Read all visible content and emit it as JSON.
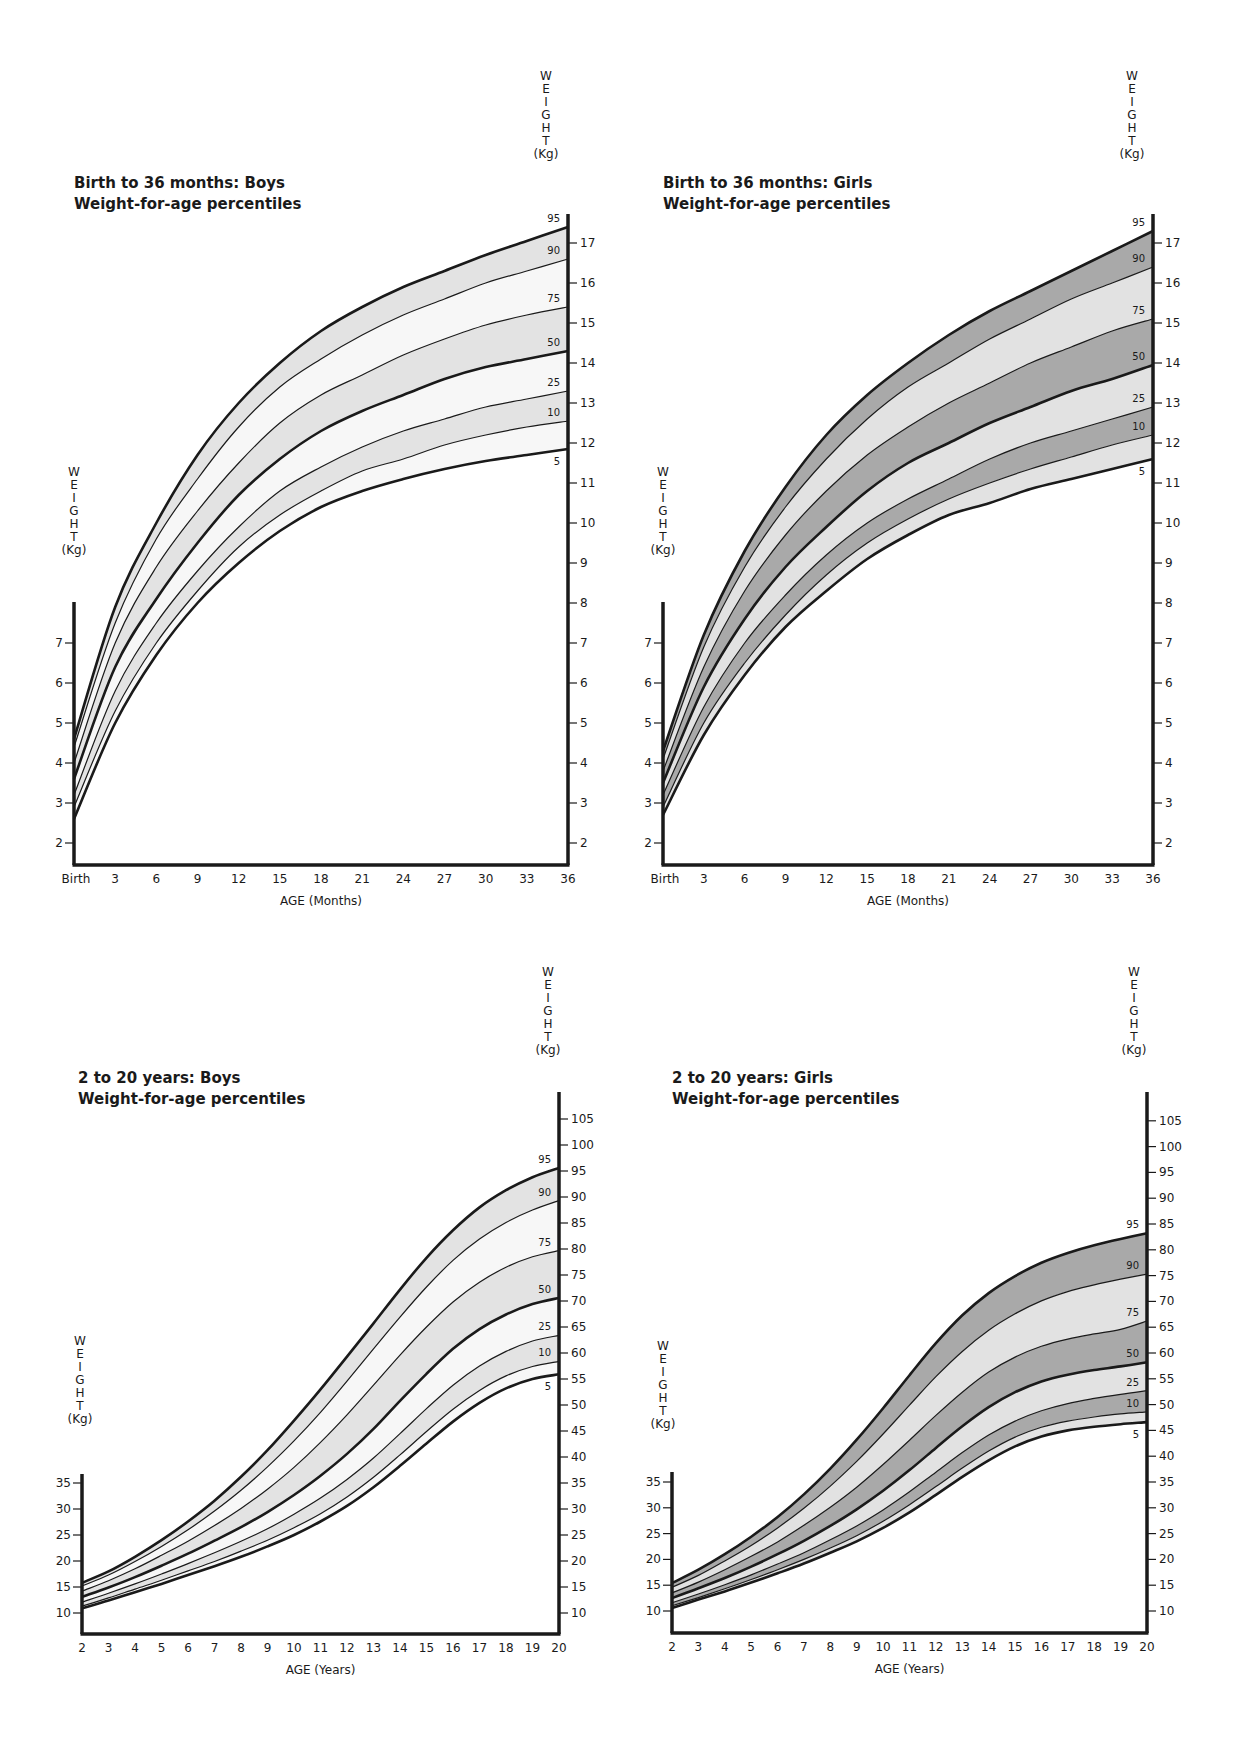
{
  "colors": {
    "ink": "#1a1a1a",
    "boys_band": "#e3e3e3",
    "boys_alt": "#f7f7f7",
    "girls_dark": "#a9a9a9",
    "girls_light": "#e2e2e2"
  },
  "chart_data": [
    {
      "id": "boys-infant",
      "type": "line",
      "title": "Birth to 36 months: Boys",
      "subtitle": "Weight-for-age percentiles",
      "xlabel": "AGE (Months)",
      "ylabel": "WEIGHT (Kg)",
      "x_ticks": [
        "Birth",
        "3",
        "6",
        "9",
        "12",
        "15",
        "18",
        "21",
        "24",
        "27",
        "30",
        "33",
        "36"
      ],
      "xlim": [
        0,
        36
      ],
      "left_y_ticks": [
        2,
        3,
        4,
        5,
        6,
        7
      ],
      "right_y_ticks": [
        2,
        3,
        4,
        5,
        6,
        7,
        8,
        9,
        10,
        11,
        12,
        13,
        14,
        15,
        16,
        17
      ],
      "ylim": [
        1.4,
        18.2
      ],
      "legend_position": "right-end labels",
      "grid": false,
      "x": [
        0,
        3,
        6,
        9,
        12,
        15,
        18,
        21,
        24,
        27,
        30,
        33,
        36
      ],
      "series": [
        {
          "name": "95",
          "values": [
            4.6,
            7.9,
            10.0,
            11.7,
            13.0,
            14.0,
            14.8,
            15.4,
            15.9,
            16.3,
            16.7,
            17.05,
            17.4
          ]
        },
        {
          "name": "90",
          "values": [
            4.4,
            7.5,
            9.6,
            11.1,
            12.4,
            13.4,
            14.1,
            14.7,
            15.2,
            15.6,
            16.0,
            16.3,
            16.6
          ]
        },
        {
          "name": "75",
          "values": [
            4.0,
            7.0,
            8.9,
            10.3,
            11.5,
            12.5,
            13.2,
            13.7,
            14.2,
            14.6,
            14.95,
            15.2,
            15.4
          ]
        },
        {
          "name": "50",
          "values": [
            3.6,
            6.4,
            8.1,
            9.5,
            10.7,
            11.6,
            12.3,
            12.8,
            13.2,
            13.6,
            13.9,
            14.1,
            14.3
          ]
        },
        {
          "name": "25",
          "values": [
            3.2,
            5.8,
            7.5,
            8.8,
            9.9,
            10.8,
            11.4,
            11.9,
            12.3,
            12.6,
            12.9,
            13.1,
            13.3
          ]
        },
        {
          "name": "10",
          "values": [
            2.9,
            5.3,
            7.0,
            8.3,
            9.4,
            10.2,
            10.8,
            11.3,
            11.6,
            11.95,
            12.2,
            12.4,
            12.55
          ]
        },
        {
          "name": "5",
          "values": [
            2.6,
            5.0,
            6.7,
            8.0,
            9.0,
            9.8,
            10.4,
            10.8,
            11.1,
            11.35,
            11.55,
            11.7,
            11.85
          ]
        }
      ],
      "thick_series": [
        "95",
        "50",
        "5"
      ],
      "bands": [
        [
          "95",
          "90",
          "boys_band"
        ],
        [
          "90",
          "75",
          "boys_alt"
        ],
        [
          "75",
          "50",
          "boys_band"
        ],
        [
          "50",
          "25",
          "boys_alt"
        ],
        [
          "25",
          "10",
          "boys_band"
        ],
        [
          "10",
          "5",
          "boys_alt"
        ]
      ],
      "layout": {
        "x0": 74,
        "x1": 568,
        "y_top_axis": 214,
        "y_left_top": 602,
        "y_bottom": 865,
        "kg_ref": 2,
        "kg_ref_y": 843,
        "px_per_kg": 40,
        "left_min": 2,
        "left_max": 7,
        "title_x": 74,
        "title_y": 188,
        "right_title_x": 546,
        "right_title_top": 80,
        "left_title_x": 74,
        "left_title_top": 476
      }
    },
    {
      "id": "girls-infant",
      "type": "line",
      "title": "Birth to 36 months: Girls",
      "subtitle": "Weight-for-age percentiles",
      "xlabel": "AGE (Months)",
      "ylabel": "WEIGHT (Kg)",
      "x_ticks": [
        "Birth",
        "3",
        "6",
        "9",
        "12",
        "15",
        "18",
        "21",
        "24",
        "27",
        "30",
        "33",
        "36"
      ],
      "xlim": [
        0,
        36
      ],
      "left_y_ticks": [
        2,
        3,
        4,
        5,
        6,
        7
      ],
      "right_y_ticks": [
        2,
        3,
        4,
        5,
        6,
        7,
        8,
        9,
        10,
        11,
        12,
        13,
        14,
        15,
        16,
        17
      ],
      "ylim": [
        1.4,
        18.2
      ],
      "legend_position": "right-end labels",
      "grid": false,
      "x": [
        0,
        3,
        6,
        9,
        12,
        15,
        18,
        21,
        24,
        27,
        30,
        33,
        36
      ],
      "series": [
        {
          "name": "95",
          "values": [
            4.3,
            7.2,
            9.3,
            10.9,
            12.2,
            13.2,
            14.0,
            14.7,
            15.3,
            15.8,
            16.3,
            16.8,
            17.3
          ]
        },
        {
          "name": "90",
          "values": [
            4.1,
            6.9,
            8.9,
            10.4,
            11.6,
            12.6,
            13.4,
            14.0,
            14.6,
            15.1,
            15.6,
            16.0,
            16.4
          ]
        },
        {
          "name": "75",
          "values": [
            3.8,
            6.4,
            8.3,
            9.7,
            10.8,
            11.7,
            12.4,
            13.0,
            13.5,
            14.0,
            14.4,
            14.8,
            15.1
          ]
        },
        {
          "name": "50",
          "values": [
            3.5,
            5.9,
            7.6,
            8.9,
            9.9,
            10.8,
            11.5,
            12.0,
            12.5,
            12.9,
            13.3,
            13.6,
            13.95
          ]
        },
        {
          "name": "25",
          "values": [
            3.2,
            5.4,
            7.0,
            8.2,
            9.2,
            10.0,
            10.6,
            11.1,
            11.6,
            12.0,
            12.3,
            12.6,
            12.9
          ]
        },
        {
          "name": "10",
          "values": [
            2.9,
            5.0,
            6.5,
            7.7,
            8.7,
            9.5,
            10.1,
            10.6,
            11.0,
            11.35,
            11.65,
            11.95,
            12.2
          ]
        },
        {
          "name": "5",
          "values": [
            2.7,
            4.7,
            6.2,
            7.4,
            8.3,
            9.1,
            9.7,
            10.2,
            10.5,
            10.85,
            11.1,
            11.35,
            11.6
          ]
        }
      ],
      "thick_series": [
        "95",
        "50",
        "5"
      ],
      "bands": [
        [
          "95",
          "90",
          "girls_dark"
        ],
        [
          "90",
          "75",
          "girls_light"
        ],
        [
          "75",
          "50",
          "girls_dark"
        ],
        [
          "50",
          "25",
          "girls_light"
        ],
        [
          "25",
          "10",
          "girls_dark"
        ],
        [
          "10",
          "5",
          "girls_light"
        ]
      ],
      "layout": {
        "x0": 663,
        "x1": 1153,
        "y_top_axis": 214,
        "y_left_top": 602,
        "y_bottom": 865,
        "kg_ref": 2,
        "kg_ref_y": 843,
        "px_per_kg": 40,
        "left_min": 2,
        "left_max": 7,
        "title_x": 663,
        "title_y": 188,
        "right_title_x": 1132,
        "right_title_top": 80,
        "left_title_x": 663,
        "left_title_top": 476
      }
    },
    {
      "id": "boys-youth",
      "type": "line",
      "title": "2 to 20 years: Boys",
      "subtitle": "Weight-for-age percentiles",
      "xlabel": "AGE (Years)",
      "ylabel": "WEIGHT (Kg)",
      "x_ticks": [
        "2",
        "3",
        "4",
        "5",
        "6",
        "7",
        "8",
        "9",
        "10",
        "11",
        "12",
        "13",
        "14",
        "15",
        "16",
        "17",
        "18",
        "19",
        "20"
      ],
      "xlim": [
        2,
        20
      ],
      "left_y_ticks": [
        10,
        15,
        20,
        25,
        30,
        35
      ],
      "right_y_ticks": [
        10,
        15,
        20,
        25,
        30,
        35,
        40,
        45,
        50,
        55,
        60,
        65,
        70,
        75,
        80,
        85,
        90,
        95,
        100,
        105
      ],
      "ylim": [
        6,
        109
      ],
      "legend_position": "right-end labels",
      "grid": false,
      "x": [
        2,
        3,
        4,
        5,
        6,
        7,
        8,
        9,
        10,
        11,
        12,
        13,
        14,
        15,
        16,
        17,
        18,
        19,
        20
      ],
      "series": [
        {
          "name": "95",
          "values": [
            15.8,
            18.0,
            20.8,
            24.0,
            27.6,
            31.6,
            36.2,
            41.3,
            47.0,
            53.0,
            59.3,
            65.7,
            72.2,
            78.3,
            83.6,
            88.0,
            91.3,
            93.8,
            95.6
          ]
        },
        {
          "name": "90",
          "values": [
            15.2,
            17.3,
            19.9,
            22.8,
            26.0,
            29.6,
            33.6,
            38.1,
            43.1,
            48.6,
            54.6,
            60.8,
            66.9,
            72.7,
            77.8,
            81.9,
            85.1,
            87.5,
            89.3
          ]
        },
        {
          "name": "75",
          "values": [
            14.2,
            16.2,
            18.5,
            21.1,
            23.8,
            26.8,
            30.1,
            33.8,
            38.0,
            42.8,
            48.1,
            53.8,
            59.6,
            65.0,
            69.8,
            73.6,
            76.5,
            78.5,
            79.7
          ]
        },
        {
          "name": "50",
          "values": [
            13.1,
            14.9,
            16.9,
            19.1,
            21.4,
            23.9,
            26.5,
            29.4,
            32.7,
            36.4,
            40.6,
            45.4,
            50.8,
            56.0,
            60.8,
            64.6,
            67.4,
            69.4,
            70.6
          ]
        },
        {
          "name": "25",
          "values": [
            12.1,
            13.8,
            15.6,
            17.5,
            19.5,
            21.6,
            23.8,
            26.2,
            29.0,
            32.1,
            35.7,
            39.8,
            44.5,
            49.3,
            53.8,
            57.5,
            60.3,
            62.3,
            63.4
          ]
        },
        {
          "name": "10",
          "values": [
            11.3,
            12.9,
            14.6,
            16.3,
            18.1,
            19.9,
            21.9,
            24.0,
            26.4,
            29.1,
            32.3,
            36.1,
            40.4,
            44.9,
            49.2,
            52.8,
            55.6,
            57.4,
            58.4
          ]
        },
        {
          "name": "5",
          "values": [
            10.9,
            12.4,
            14.0,
            15.6,
            17.3,
            19.0,
            20.8,
            22.8,
            25.0,
            27.6,
            30.6,
            34.2,
            38.3,
            42.6,
            46.8,
            50.4,
            53.2,
            55.0,
            55.9
          ]
        }
      ],
      "thick_series": [
        "95",
        "50",
        "5"
      ],
      "bands": [
        [
          "95",
          "90",
          "boys_band"
        ],
        [
          "90",
          "75",
          "boys_alt"
        ],
        [
          "75",
          "50",
          "boys_band"
        ],
        [
          "50",
          "25",
          "boys_alt"
        ],
        [
          "25",
          "10",
          "boys_band"
        ],
        [
          "10",
          "5",
          "boys_alt"
        ]
      ],
      "layout": {
        "x0": 82,
        "x1": 559,
        "y_top_axis": 1092,
        "y_left_top": 1474,
        "y_bottom": 1634,
        "kg_ref": 10,
        "kg_ref_y": 1613,
        "px_per_kg": 5.2,
        "left_min": 10,
        "left_max": 35,
        "title_x": 78,
        "title_y": 1083,
        "right_title_x": 548,
        "right_title_top": 976,
        "left_title_x": 80,
        "left_title_top": 1345
      }
    },
    {
      "id": "girls-youth",
      "type": "line",
      "title": "2 to 20 years: Girls",
      "subtitle": "Weight-for-age percentiles",
      "xlabel": "AGE (Years)",
      "ylabel": "WEIGHT (Kg)",
      "x_ticks": [
        "2",
        "3",
        "4",
        "5",
        "6",
        "7",
        "8",
        "9",
        "10",
        "11",
        "12",
        "13",
        "14",
        "15",
        "16",
        "17",
        "18",
        "19",
        "20"
      ],
      "xlim": [
        2,
        20
      ],
      "left_y_ticks": [
        10,
        15,
        20,
        25,
        30,
        35
      ],
      "right_y_ticks": [
        10,
        15,
        20,
        25,
        30,
        35,
        40,
        45,
        50,
        55,
        60,
        65,
        70,
        75,
        80,
        85,
        90,
        95,
        100,
        105
      ],
      "ylim": [
        6,
        109
      ],
      "legend_position": "right-end labels",
      "grid": false,
      "x": [
        2,
        3,
        4,
        5,
        6,
        7,
        8,
        9,
        10,
        11,
        12,
        13,
        14,
        15,
        16,
        17,
        18,
        19,
        20
      ],
      "series": [
        {
          "name": "95",
          "values": [
            15.4,
            18.0,
            21.0,
            24.4,
            28.2,
            32.6,
            37.6,
            43.2,
            49.3,
            55.7,
            61.9,
            67.3,
            71.6,
            74.9,
            77.5,
            79.4,
            80.9,
            82.1,
            83.2
          ]
        },
        {
          "name": "90",
          "values": [
            14.6,
            16.9,
            19.7,
            22.7,
            26.1,
            29.9,
            34.2,
            39.0,
            44.3,
            49.9,
            55.4,
            60.3,
            64.4,
            67.6,
            70.1,
            71.9,
            73.2,
            74.3,
            75.3
          ]
        },
        {
          "name": "75",
          "values": [
            13.5,
            15.6,
            18.0,
            20.6,
            23.4,
            26.6,
            30.1,
            34.0,
            38.4,
            43.1,
            47.9,
            52.4,
            56.3,
            59.2,
            61.3,
            62.7,
            63.7,
            64.6,
            66.2
          ]
        },
        {
          "name": "50",
          "values": [
            12.5,
            14.4,
            16.4,
            18.6,
            21.0,
            23.6,
            26.5,
            29.7,
            33.3,
            37.3,
            41.6,
            45.8,
            49.5,
            52.4,
            54.5,
            55.8,
            56.7,
            57.4,
            58.2
          ]
        },
        {
          "name": "25",
          "values": [
            11.6,
            13.3,
            15.1,
            17.0,
            19.1,
            21.3,
            23.8,
            26.5,
            29.6,
            33.1,
            36.9,
            40.7,
            44.1,
            46.8,
            48.8,
            50.2,
            51.2,
            52.0,
            52.7
          ]
        },
        {
          "name": "10",
          "values": [
            11.0,
            12.6,
            14.3,
            16.1,
            18.0,
            20.0,
            22.2,
            24.6,
            27.4,
            30.6,
            34.1,
            37.7,
            41.0,
            43.7,
            45.6,
            46.8,
            47.6,
            48.2,
            48.6
          ]
        },
        {
          "name": "5",
          "values": [
            10.6,
            12.2,
            13.8,
            15.5,
            17.3,
            19.2,
            21.3,
            23.5,
            26.1,
            29.1,
            32.5,
            36.0,
            39.2,
            41.9,
            43.8,
            45.0,
            45.7,
            46.2,
            46.6
          ]
        }
      ],
      "thick_series": [
        "95",
        "50",
        "5"
      ],
      "bands": [
        [
          "95",
          "90",
          "girls_dark"
        ],
        [
          "90",
          "75",
          "girls_light"
        ],
        [
          "75",
          "50",
          "girls_dark"
        ],
        [
          "50",
          "25",
          "girls_light"
        ],
        [
          "25",
          "10",
          "girls_dark"
        ],
        [
          "10",
          "5",
          "girls_light"
        ]
      ],
      "layout": {
        "x0": 672,
        "x1": 1147,
        "y_top_axis": 1092,
        "y_left_top": 1472,
        "y_bottom": 1633,
        "kg_ref": 10,
        "kg_ref_y": 1611,
        "px_per_kg": 5.16,
        "left_min": 10,
        "left_max": 35,
        "title_x": 672,
        "title_y": 1083,
        "right_title_x": 1134,
        "right_title_top": 976,
        "left_title_x": 663,
        "left_title_top": 1350
      }
    }
  ]
}
